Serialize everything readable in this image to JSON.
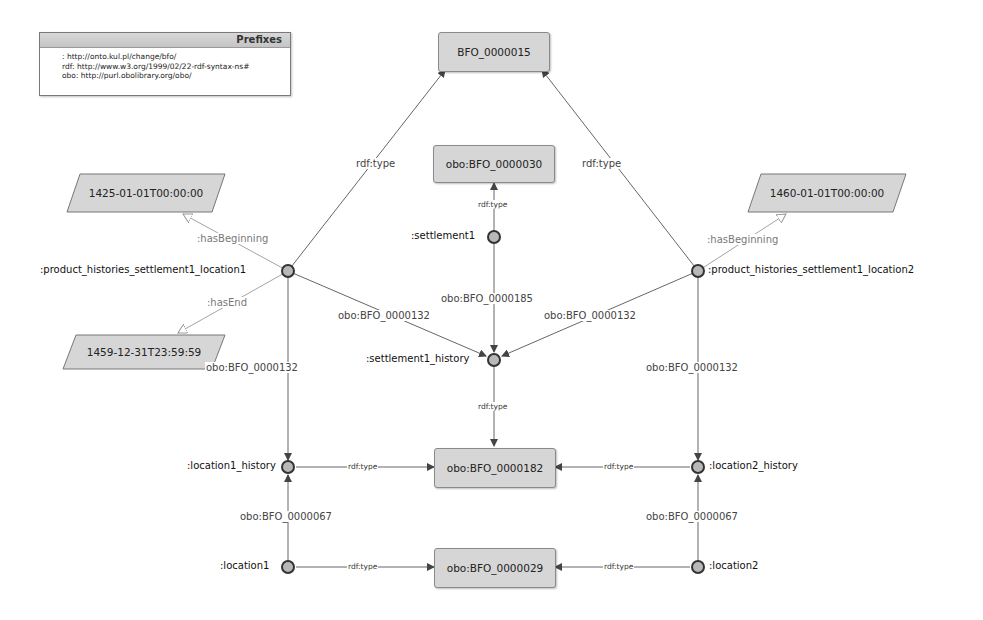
{
  "prefixes": {
    "title": "Prefixes",
    "lines": [
      ": http://onto.kul.pl/change/bfo/",
      "rdf: http://www.w3.org/1999/02/22-rdf-syntax-ns#",
      "obo: http://purl.obolibrary.org/obo/"
    ]
  },
  "classes": {
    "bfo15": "BFO_0000015",
    "bfo30": "obo:BFO_0000030",
    "bfo182": "obo:BFO_0000182",
    "bfo29": "obo:BFO_0000029"
  },
  "literals": {
    "begin1": "1425-01-01T00:00:00",
    "end1": "1459-12-31T23:59:59",
    "begin2": "1460-01-01T00:00:00"
  },
  "individuals": {
    "p1": ":product_histories_settlement1_location1",
    "p2": ":product_histories_settlement1_location2",
    "settlement1": ":settlement1",
    "settlement1_history": ":settlement1_history",
    "location1_history": ":location1_history",
    "location2_history": ":location2_history",
    "location1": ":location1",
    "location2": ":location2"
  },
  "edges": {
    "p1_type": "rdf:type",
    "p2_type": "rdf:type",
    "settlement1_type": "rdf:type",
    "p1_hasBeginning": ":hasBeginning",
    "p1_hasEnd": ":hasEnd",
    "p2_hasBeginning": ":hasBeginning",
    "p1_sh": "obo:BFO_0000132",
    "p2_sh": "obo:BFO_0000132",
    "s1_sh": "obo:BFO_0000185",
    "p1_l1h": "obo:BFO_0000132",
    "p2_l2h": "obo:BFO_0000132",
    "sh_type": "rdf:type",
    "l1h_type": "rdf:type",
    "l2h_type": "rdf:type",
    "l1_l1h": "obo:BFO_0000067",
    "l2_l2h": "obo:BFO_0000067",
    "l1_type": "rdf:type",
    "l2_type": "rdf:type"
  },
  "colors": {
    "class_fill": "#d6d6d6",
    "node_fill": "#b8b8b8",
    "edge": "#555555",
    "literal_edge": "#9a9a9a"
  }
}
